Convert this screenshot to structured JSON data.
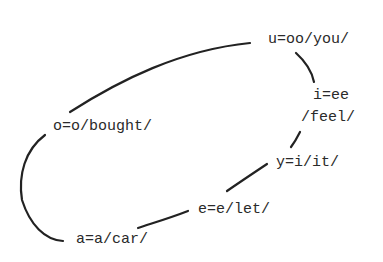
{
  "diagram": {
    "type": "vowel-loop",
    "nodes": [
      {
        "id": "u",
        "label": "u=oo/you/"
      },
      {
        "id": "i",
        "label_line1": "i=ee",
        "label_line2": "/feel/"
      },
      {
        "id": "y",
        "label": "y=i/it/"
      },
      {
        "id": "e",
        "label": "e=e/let/"
      },
      {
        "id": "a",
        "label": "a=a/car/"
      },
      {
        "id": "o",
        "label": "o=o/bought/"
      }
    ],
    "edges": [
      [
        "u",
        "i"
      ],
      [
        "i",
        "y"
      ],
      [
        "y",
        "e"
      ],
      [
        "e",
        "a"
      ],
      [
        "a",
        "o"
      ],
      [
        "o",
        "u"
      ]
    ],
    "stroke_color": "#222222"
  }
}
